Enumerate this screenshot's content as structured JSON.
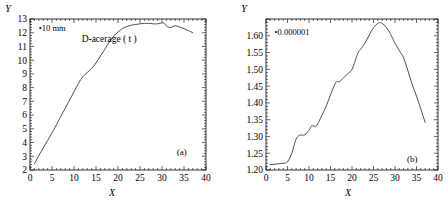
{
  "figure": {
    "panels": [
      {
        "panel_label": "(a)",
        "annotation": "•10 mm",
        "curve_label": "D-acerage ( t )",
        "xlabel": "X",
        "ylabel": "Y"
      },
      {
        "panel_label": "(b)",
        "annotation": "•0.000001",
        "curve_label": "",
        "xlabel": "X",
        "ylabel": "Y"
      }
    ]
  },
  "chart_data": [
    {
      "type": "line",
      "title": "",
      "subtitle": "",
      "panel_label": "(a)",
      "xlabel": "X",
      "ylabel": "Y",
      "xlim": [
        0,
        40
      ],
      "ylim": [
        2,
        13
      ],
      "xticks": [
        0,
        5,
        10,
        15,
        20,
        25,
        30,
        35,
        40
      ],
      "xticklabels": [
        "0",
        "5",
        "10",
        "15",
        "20",
        "25",
        "30",
        "35",
        "40"
      ],
      "yticks": [
        2,
        3,
        4,
        5,
        6,
        7,
        8,
        9,
        10,
        11,
        12,
        13
      ],
      "yticklabels": [
        "2",
        "3",
        "4",
        "5",
        "6",
        "7",
        "8",
        "9",
        "10",
        "11",
        "12",
        "13"
      ],
      "grid": false,
      "legend": null,
      "annotations": [
        {
          "text": "•10 mm",
          "x": 2.0,
          "y": 12.1
        },
        {
          "text": "D-acerage ( t )",
          "x": 18.0,
          "y": 11.3
        },
        {
          "text": "(a)",
          "x": 34.5,
          "y": 3.1
        }
      ],
      "series": [
        {
          "name": "D-acerage ( t )",
          "x": [
            1.0,
            2.0,
            3.0,
            4.0,
            5.0,
            6.0,
            7.0,
            8.0,
            9.0,
            10.0,
            11.0,
            12.0,
            13.0,
            14.0,
            15.0,
            16.0,
            17.0,
            18.0,
            19.0,
            20.0,
            21.0,
            22.0,
            23.0,
            24.0,
            25.0,
            26.0,
            27.0,
            28.0,
            29.0,
            30.0,
            30.5,
            31.0,
            31.5,
            32.0,
            32.5,
            33.0,
            34.0,
            35.0,
            36.0,
            37.0
          ],
          "y": [
            2.45,
            3.05,
            3.6,
            4.15,
            4.7,
            5.3,
            5.9,
            6.5,
            7.1,
            7.7,
            8.3,
            8.8,
            9.1,
            9.4,
            9.8,
            10.3,
            10.8,
            11.3,
            11.75,
            12.05,
            12.3,
            12.45,
            12.55,
            12.6,
            12.65,
            12.68,
            12.68,
            12.65,
            12.65,
            12.72,
            12.68,
            12.5,
            12.4,
            12.38,
            12.45,
            12.5,
            12.42,
            12.3,
            12.15,
            12.0
          ]
        }
      ]
    },
    {
      "type": "line",
      "title": "",
      "subtitle": "",
      "panel_label": "(b)",
      "xlabel": "X",
      "ylabel": "Y",
      "xlim": [
        0,
        40
      ],
      "ylim": [
        1.2,
        1.65
      ],
      "xticks": [
        0,
        5,
        10,
        15,
        20,
        25,
        30,
        35,
        40
      ],
      "xticklabels": [
        "0",
        "5",
        "10",
        "15",
        "20",
        "25",
        "30",
        "35",
        "40"
      ],
      "yticks": [
        1.2,
        1.25,
        1.3,
        1.35,
        1.4,
        1.45,
        1.5,
        1.55,
        1.6,
        1.65
      ],
      "yticklabels": [
        "1.20",
        "1.25",
        "1.30",
        "1.35",
        "1.40",
        "1.45",
        "1.50",
        "1.55",
        "1.60",
        ""
      ],
      "grid": false,
      "legend": null,
      "annotations": [
        {
          "text": "•0.000001",
          "x": 2.0,
          "y": 1.602
        },
        {
          "text": "(b)",
          "x": 34.0,
          "y": 1.225
        }
      ],
      "series": [
        {
          "name": "curve-b",
          "x": [
            1.0,
            2.0,
            3.0,
            4.0,
            5.0,
            6.0,
            6.5,
            7.0,
            7.5,
            8.0,
            9.0,
            10.0,
            10.5,
            11.0,
            11.5,
            12.0,
            13.0,
            14.0,
            15.0,
            16.0,
            16.5,
            17.0,
            18.0,
            19.0,
            20.0,
            21.0,
            21.5,
            22.0,
            23.0,
            24.0,
            25.0,
            26.0,
            26.5,
            27.0,
            28.0,
            29.0,
            30.0,
            31.0,
            32.0,
            33.0,
            34.0,
            35.0,
            36.0,
            37.0
          ],
          "y": [
            1.216,
            1.217,
            1.219,
            1.22,
            1.224,
            1.25,
            1.272,
            1.292,
            1.301,
            1.304,
            1.305,
            1.318,
            1.33,
            1.332,
            1.33,
            1.337,
            1.363,
            1.39,
            1.424,
            1.455,
            1.464,
            1.463,
            1.474,
            1.487,
            1.5,
            1.535,
            1.552,
            1.56,
            1.578,
            1.602,
            1.624,
            1.637,
            1.639,
            1.637,
            1.625,
            1.604,
            1.578,
            1.556,
            1.534,
            1.496,
            1.455,
            1.42,
            1.382,
            1.342
          ]
        }
      ]
    }
  ]
}
